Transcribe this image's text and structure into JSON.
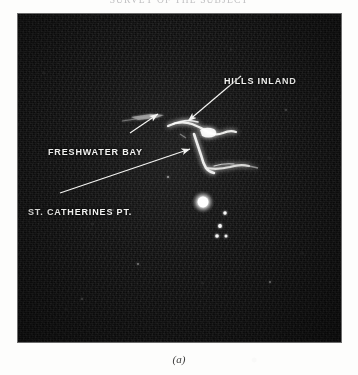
{
  "page": {
    "running_head": "SURVEY OF THE SUBJECT",
    "background_color": "#fdfdfc"
  },
  "figure": {
    "caption": "(a)",
    "plate": {
      "name": "radar-ppi-photograph",
      "background_color": "#090909",
      "border_color": "#6d6d6d",
      "echo_color": "#ffffff",
      "description_visible": false
    },
    "annotations": [
      {
        "id": "hills-inland",
        "label": "HILLS INLAND",
        "text_x": 206,
        "text_y": 62,
        "arrow_from_x": 241,
        "arrow_from_y": 76,
        "arrow_to_x": 186,
        "arrow_to_y": 119
      },
      {
        "id": "freshwater-bay",
        "label": "FRESHWATER BAY",
        "text_x": 30,
        "text_y": 133,
        "arrow_from_x": 130,
        "arrow_from_y": 130,
        "arrow_to_x": 156,
        "arrow_to_y": 113
      },
      {
        "id": "st-catherines-pt",
        "label": "ST. CATHERINES PT.",
        "text_x": 10,
        "text_y": 193,
        "arrow_from_x": 60,
        "arrow_from_y": 190,
        "arrow_to_x": 188,
        "arrow_to_y": 148
      }
    ],
    "echoes": {
      "coastline_label": "coast-echo-trace",
      "bright_blob": {
        "cx": 185,
        "cy": 188,
        "r": 7
      },
      "point_targets": [
        {
          "cx": 207,
          "cy": 199,
          "r": 1.6
        },
        {
          "cx": 202,
          "cy": 212,
          "r": 1.8
        },
        {
          "cx": 199,
          "cy": 222,
          "r": 1.7
        },
        {
          "cx": 208,
          "cy": 222,
          "r": 1.5
        },
        {
          "cx": 150,
          "cy": 163,
          "r": 1.0
        },
        {
          "cx": 120,
          "cy": 250,
          "r": 0.9
        },
        {
          "cx": 252,
          "cy": 268,
          "r": 0.9
        },
        {
          "cx": 64,
          "cy": 285,
          "r": 0.8
        }
      ]
    }
  }
}
